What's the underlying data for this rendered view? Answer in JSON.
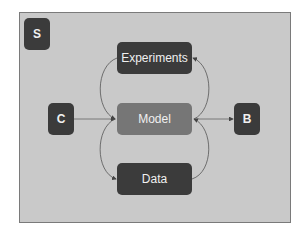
{
  "diagram": {
    "colors": {
      "background": "#c9c9c9",
      "frame_border": "#7a7a7a",
      "dark_node": "#3b3b3b",
      "model_node": "#767676",
      "edge": "#555555",
      "text": "#f0f0f0"
    },
    "nodes": {
      "s": {
        "label": "S"
      },
      "c": {
        "label": "C"
      },
      "b": {
        "label": "B"
      },
      "experiments": {
        "label": "Experiments"
      },
      "model": {
        "label": "Model"
      },
      "data": {
        "label": "Data"
      }
    },
    "edges": [
      {
        "from": "C",
        "to": "Model"
      },
      {
        "from": "Model",
        "to": "B"
      },
      {
        "from": "Experiments",
        "to": "Model",
        "side": "left"
      },
      {
        "from": "Model",
        "to": "Data",
        "side": "left"
      },
      {
        "from": "Data",
        "to": "Model",
        "side": "right"
      },
      {
        "from": "Model",
        "to": "Experiments",
        "side": "right"
      }
    ]
  }
}
